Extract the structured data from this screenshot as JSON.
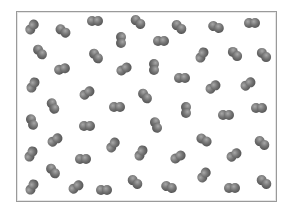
{
  "diagram": {
    "box": {
      "x": 16,
      "y": 11,
      "width": 261,
      "height": 191,
      "border_color": "#9a9a9a"
    },
    "molecule_color": "#666666",
    "molecules": [
      {
        "x": 32,
        "y": 27,
        "angle": -55
      },
      {
        "x": 63,
        "y": 31,
        "angle": 35
      },
      {
        "x": 95,
        "y": 21,
        "angle": 0
      },
      {
        "x": 138,
        "y": 22,
        "angle": 40
      },
      {
        "x": 179,
        "y": 27,
        "angle": 40
      },
      {
        "x": 216,
        "y": 27,
        "angle": 20
      },
      {
        "x": 252,
        "y": 23,
        "angle": 0
      },
      {
        "x": 40,
        "y": 52,
        "angle": 50
      },
      {
        "x": 96,
        "y": 56,
        "angle": 50
      },
      {
        "x": 121,
        "y": 40,
        "angle": 90
      },
      {
        "x": 161,
        "y": 41,
        "angle": 0
      },
      {
        "x": 202,
        "y": 55,
        "angle": -60
      },
      {
        "x": 235,
        "y": 54,
        "angle": 45
      },
      {
        "x": 264,
        "y": 55,
        "angle": 45
      },
      {
        "x": 62,
        "y": 69,
        "angle": -15
      },
      {
        "x": 124,
        "y": 69,
        "angle": -30
      },
      {
        "x": 154,
        "y": 67,
        "angle": 90
      },
      {
        "x": 33,
        "y": 85,
        "angle": -60
      },
      {
        "x": 87,
        "y": 93,
        "angle": -35
      },
      {
        "x": 182,
        "y": 78,
        "angle": 0
      },
      {
        "x": 213,
        "y": 87,
        "angle": -35
      },
      {
        "x": 248,
        "y": 84,
        "angle": -35
      },
      {
        "x": 145,
        "y": 96,
        "angle": 50
      },
      {
        "x": 53,
        "y": 106,
        "angle": 65
      },
      {
        "x": 117,
        "y": 107,
        "angle": 0
      },
      {
        "x": 186,
        "y": 110,
        "angle": 90
      },
      {
        "x": 226,
        "y": 115,
        "angle": 0
      },
      {
        "x": 259,
        "y": 108,
        "angle": 0
      },
      {
        "x": 32,
        "y": 122,
        "angle": 70
      },
      {
        "x": 87,
        "y": 126,
        "angle": 0
      },
      {
        "x": 156,
        "y": 125,
        "angle": 70
      },
      {
        "x": 55,
        "y": 140,
        "angle": -35
      },
      {
        "x": 113,
        "y": 145,
        "angle": -55
      },
      {
        "x": 141,
        "y": 153,
        "angle": -60
      },
      {
        "x": 178,
        "y": 157,
        "angle": -30
      },
      {
        "x": 204,
        "y": 140,
        "angle": 30
      },
      {
        "x": 262,
        "y": 143,
        "angle": 40
      },
      {
        "x": 234,
        "y": 155,
        "angle": -35
      },
      {
        "x": 31,
        "y": 154,
        "angle": -60
      },
      {
        "x": 83,
        "y": 159,
        "angle": 0
      },
      {
        "x": 53,
        "y": 171,
        "angle": 50
      },
      {
        "x": 32,
        "y": 187,
        "angle": -60
      },
      {
        "x": 76,
        "y": 187,
        "angle": -35
      },
      {
        "x": 104,
        "y": 190,
        "angle": 0
      },
      {
        "x": 135,
        "y": 182,
        "angle": 40
      },
      {
        "x": 169,
        "y": 187,
        "angle": 20
      },
      {
        "x": 204,
        "y": 175,
        "angle": -55
      },
      {
        "x": 232,
        "y": 188,
        "angle": 0
      },
      {
        "x": 264,
        "y": 182,
        "angle": 40
      }
    ]
  }
}
